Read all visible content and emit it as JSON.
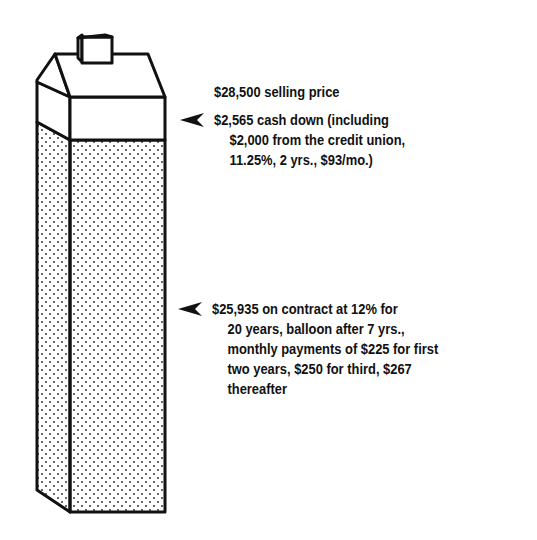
{
  "diagram": {
    "selling_price": {
      "text": "$28,500 selling price"
    },
    "cash_down": {
      "lines": [
        "$2,565 cash down (including",
        "$2,000 from the credit union,",
        "11.25%, 2 yrs., $93/mo.)"
      ]
    },
    "contract": {
      "lines": [
        "$25,935 on contract at 12% for",
        "20 years, balloon after 7 yrs.,",
        "monthly payments of $225 for first",
        "two years, $250 for third, $267",
        "thereafter"
      ]
    },
    "icons": {
      "pointer": "arrowhead-left-icon",
      "house": "house-block-icon"
    },
    "colors": {
      "ink": "#111111",
      "background": "#ffffff"
    }
  }
}
